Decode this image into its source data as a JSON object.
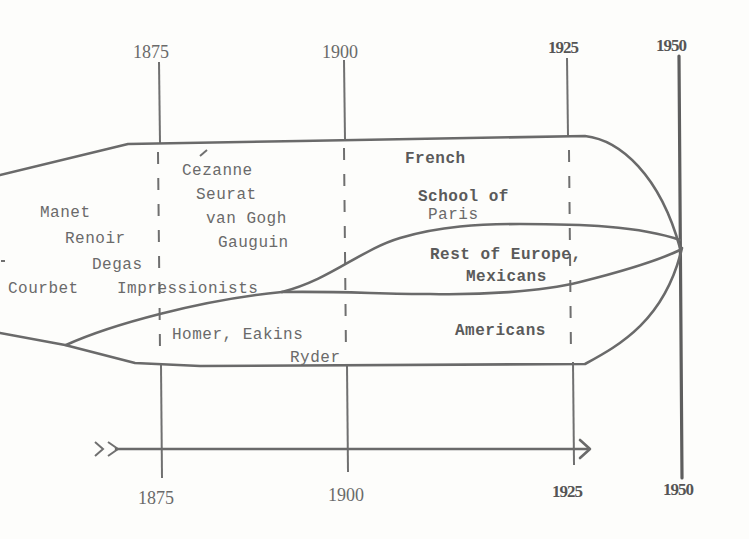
{
  "diagram": {
    "type": "timeline-flow",
    "axis": {
      "top_ticks": [
        "1875",
        "1900",
        "1925",
        "1950"
      ],
      "bottom_ticks": [
        "1875",
        "1900",
        "1925",
        "1950"
      ]
    },
    "periods": {
      "early": {
        "artists": [
          "Manet",
          "Renoir",
          "Degas",
          "Courbet"
        ]
      },
      "impressionists_label": "Impressionists",
      "post_impressionists": {
        "artists": [
          "Cezanne",
          "Seurat",
          "van Gogh",
          "Gauguin"
        ]
      }
    },
    "streams": {
      "french": "French",
      "school_of_paris_1": "School of",
      "school_of_paris_2": "Paris",
      "rest_of_europe_1": "Rest of Europe,",
      "rest_of_europe_2": "Mexicans",
      "americans": "Americans",
      "american_early_1": "Homer, Eakins",
      "american_early_2": "Ryder"
    },
    "colors": {
      "ink": "#6a6a6a",
      "paper": "#fdfdfb"
    }
  }
}
